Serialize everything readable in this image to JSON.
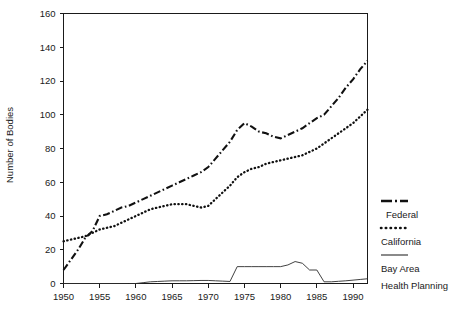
{
  "chart_data": {
    "type": "line",
    "title": "",
    "xlabel": "",
    "ylabel": "Number of Bodies",
    "xlim": [
      1950,
      1992
    ],
    "ylim": [
      0,
      160
    ],
    "grid": false,
    "legend_position": "right",
    "x_ticks": [
      "1950",
      "1955",
      "1960",
      "1965",
      "1970",
      "1975",
      "1980",
      "1985",
      "1990"
    ],
    "x_tick_values": [
      1950,
      1955,
      1960,
      1965,
      1970,
      1975,
      1980,
      1985,
      1990
    ],
    "y_ticks": [
      "0",
      "20",
      "40",
      "60",
      "80",
      "100",
      "120",
      "140",
      "160"
    ],
    "y_tick_values": [
      0,
      20,
      40,
      60,
      80,
      100,
      120,
      140,
      160
    ],
    "series": [
      {
        "name": "Federal",
        "style": "dash-dot",
        "color": "#111111",
        "x": [
          1950,
          1951,
          1952,
          1953,
          1954,
          1955,
          1956,
          1957,
          1958,
          1959,
          1960,
          1961,
          1962,
          1963,
          1964,
          1965,
          1966,
          1967,
          1968,
          1969,
          1970,
          1971,
          1972,
          1973,
          1974,
          1975,
          1976,
          1977,
          1978,
          1979,
          1980,
          1981,
          1982,
          1983,
          1984,
          1985,
          1986,
          1987,
          1988,
          1989,
          1990,
          1991,
          1992
        ],
        "values": [
          8,
          14,
          20,
          27,
          31,
          40,
          41,
          43,
          45,
          46,
          48,
          50,
          52,
          54,
          56,
          58,
          60,
          62,
          64,
          66,
          69,
          74,
          79,
          84,
          91,
          95,
          93,
          90,
          89,
          87,
          86,
          88,
          90,
          92,
          95,
          98,
          100,
          105,
          110,
          116,
          121,
          127,
          132
        ]
      },
      {
        "name": "California",
        "style": "dotted",
        "color": "#111111",
        "x": [
          1950,
          1951,
          1952,
          1953,
          1954,
          1955,
          1956,
          1957,
          1958,
          1959,
          1960,
          1961,
          1962,
          1963,
          1964,
          1965,
          1966,
          1967,
          1968,
          1969,
          1970,
          1971,
          1972,
          1973,
          1974,
          1975,
          1976,
          1977,
          1978,
          1979,
          1980,
          1981,
          1982,
          1983,
          1984,
          1985,
          1986,
          1987,
          1988,
          1989,
          1990,
          1991,
          1992
        ],
        "values": [
          25,
          26,
          27,
          28,
          30,
          32,
          33,
          34,
          36,
          38,
          40,
          42,
          44,
          45,
          46,
          47,
          47,
          47,
          46,
          45,
          46,
          50,
          54,
          58,
          63,
          66,
          68,
          69,
          71,
          72,
          73,
          74,
          75,
          76,
          78,
          80,
          83,
          86,
          89,
          92,
          95,
          99,
          103
        ]
      },
      {
        "name": "Bay Area Health Planning",
        "style": "solid",
        "color": "#2b2b2b",
        "x": [
          1950,
          1955,
          1959,
          1960,
          1961,
          1962,
          1963,
          1964,
          1965,
          1966,
          1967,
          1968,
          1969,
          1970,
          1971,
          1972,
          1973,
          1974,
          1975,
          1976,
          1977,
          1978,
          1979,
          1980,
          1981,
          1982,
          1983,
          1984,
          1985,
          1986,
          1987,
          1988,
          1989,
          1990,
          1991,
          1992
        ],
        "values": [
          0,
          0,
          0,
          0,
          0.5,
          1,
          1.2,
          1.4,
          1.6,
          1.6,
          1.6,
          1.7,
          1.8,
          1.8,
          1.6,
          1.4,
          1.2,
          10,
          10,
          10,
          10,
          10,
          10,
          10,
          11,
          13,
          12,
          8,
          8,
          1,
          1,
          1.3,
          1.6,
          2,
          2.4,
          2.8
        ]
      }
    ],
    "legend": [
      {
        "label": "Federal",
        "style": "dash-dot"
      },
      {
        "label": "California",
        "style": "dotted"
      },
      {
        "label": "Bay Area",
        "style": "solid"
      },
      {
        "label": "Health Planning",
        "style": "none"
      }
    ]
  }
}
